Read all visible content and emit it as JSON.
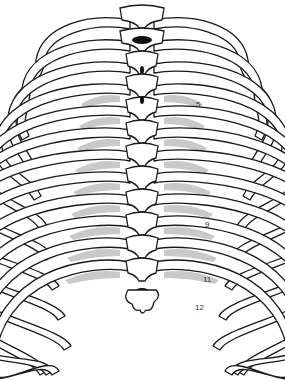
{
  "figure": {
    "style": "line drawing with grey shaded intercostal regions",
    "colors": {
      "background": "#ffffff",
      "line": "#1a1a1a",
      "shade": "#c9c9c9",
      "canal": "#111111"
    },
    "rib_labels": [
      {
        "text": "5",
        "x": 196,
        "y": 107
      },
      {
        "text": "9",
        "x": 205,
        "y": 227
      },
      {
        "text": "11",
        "x": 203,
        "y": 282
      },
      {
        "text": "12",
        "x": 195,
        "y": 310
      }
    ]
  }
}
